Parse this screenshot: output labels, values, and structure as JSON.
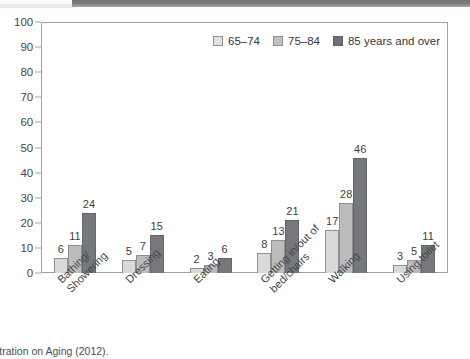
{
  "chart_data": {
    "type": "bar",
    "title": "",
    "subtitle": "",
    "xlabel": "",
    "ylabel": "",
    "ylim": [
      0,
      100
    ],
    "yticks": [
      0,
      10,
      20,
      30,
      40,
      50,
      60,
      70,
      80,
      90,
      100
    ],
    "grid": false,
    "legend_position": "top-right",
    "categories": [
      "Bathing/ Showering",
      "Dressing",
      "Eating",
      "Getting in/out of bed/chairs",
      "Walking",
      "Using toilet"
    ],
    "category_lines": [
      [
        "Bathing/",
        "Showering"
      ],
      [
        "Dressing"
      ],
      [
        "Eating"
      ],
      [
        "Getting in/out of",
        "bed/chairs"
      ],
      [
        "Walking"
      ],
      [
        "Using toilet"
      ]
    ],
    "series": [
      {
        "name": "65–74",
        "color": "#d9d9d9",
        "values": [
          6,
          5,
          2,
          8,
          17,
          3
        ]
      },
      {
        "name": "75–84",
        "color": "#bcbcbc",
        "values": [
          11,
          7,
          3,
          13,
          28,
          5
        ]
      },
      {
        "name": "85 years and over",
        "color": "#76787c",
        "values": [
          24,
          15,
          6,
          21,
          46,
          11
        ]
      }
    ]
  },
  "legend": {
    "items": [
      {
        "label": "65–74"
      },
      {
        "label": "75–84"
      },
      {
        "label": "85 years and over"
      }
    ]
  },
  "source": {
    "caption": "Administration on Aging (2012)."
  }
}
